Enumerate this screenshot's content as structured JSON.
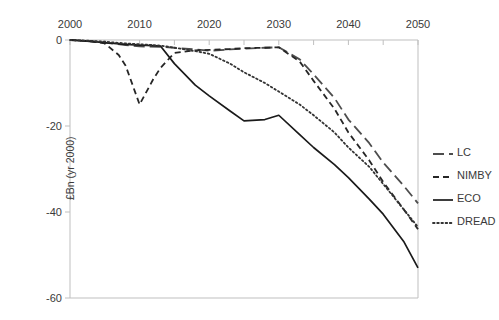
{
  "chart_data": {
    "type": "line",
    "title": "",
    "xlabel": "",
    "ylabel": "£Bn (yr 2000)",
    "xlim": [
      2000,
      2050
    ],
    "ylim": [
      -60,
      0
    ],
    "x_ticks": [
      2000,
      2010,
      2020,
      2030,
      2040,
      2050
    ],
    "x_tick_labels": [
      "2000",
      "2010",
      "2020",
      "2030",
      "2040",
      "2050"
    ],
    "x_minor_tick_interval": 5,
    "y_ticks": [
      0,
      -20,
      -40,
      -60
    ],
    "y_tick_labels": [
      "0",
      "-20",
      "-40",
      "-60"
    ],
    "grid": false,
    "x_axis_position": "top",
    "legend_position": "right",
    "series": [
      {
        "name": "LC",
        "style": "long-dash",
        "color": "#4d4d4d",
        "x": [
          2000,
          2003,
          2005,
          2008,
          2010,
          2013,
          2015,
          2018,
          2020,
          2023,
          2025,
          2028,
          2030,
          2033,
          2035,
          2038,
          2040,
          2043,
          2045,
          2048,
          2050
        ],
        "values": [
          0,
          -0.3,
          -0.6,
          -1.2,
          -1.5,
          -1.6,
          -1.8,
          -2.2,
          -2.5,
          -2.2,
          -2.0,
          -1.8,
          -1.7,
          -4.5,
          -8.0,
          -13.5,
          -18.5,
          -24.0,
          -28.5,
          -34.0,
          -38.0
        ]
      },
      {
        "name": "NIMBY",
        "style": "dash",
        "color": "#262626",
        "x": [
          2000,
          2003,
          2005,
          2007,
          2008,
          2010,
          2012,
          2013,
          2015,
          2017,
          2018,
          2020,
          2023,
          2025,
          2028,
          2030,
          2033,
          2035,
          2038,
          2040,
          2043,
          2045,
          2048,
          2050
        ],
        "values": [
          0,
          -0.3,
          -0.8,
          -3.5,
          -6.0,
          -15.0,
          -9.0,
          -6.5,
          -3.0,
          -2.6,
          -2.4,
          -2.3,
          -2.1,
          -1.9,
          -1.8,
          -1.7,
          -5.0,
          -9.5,
          -16.0,
          -21.5,
          -28.0,
          -33.0,
          -39.5,
          -44.0
        ]
      },
      {
        "name": "ECO",
        "style": "solid",
        "color": "#1a1a1a",
        "x": [
          2000,
          2003,
          2005,
          2008,
          2010,
          2012,
          2013,
          2015,
          2018,
          2020,
          2023,
          2025,
          2028,
          2030,
          2033,
          2035,
          2038,
          2040,
          2043,
          2045,
          2048,
          2050
        ],
        "values": [
          0,
          -0.3,
          -0.6,
          -1.0,
          -1.2,
          -1.3,
          -1.4,
          -5.5,
          -10.5,
          -13.0,
          -16.5,
          -18.8,
          -18.5,
          -17.5,
          -22.0,
          -25.0,
          -29.0,
          -32.0,
          -37.0,
          -40.5,
          -47.0,
          -53.0
        ]
      },
      {
        "name": "DREAD",
        "style": "dot",
        "color": "#333333",
        "x": [
          2000,
          2003,
          2005,
          2008,
          2010,
          2013,
          2015,
          2018,
          2020,
          2023,
          2025,
          2028,
          2030,
          2033,
          2035,
          2038,
          2040,
          2043,
          2045,
          2048,
          2050
        ],
        "values": [
          0,
          -0.2,
          -0.4,
          -0.8,
          -1.0,
          -1.3,
          -1.8,
          -2.6,
          -3.2,
          -5.5,
          -7.5,
          -10.0,
          -12.0,
          -15.0,
          -17.5,
          -21.5,
          -25.0,
          -29.5,
          -33.5,
          -39.5,
          -43.5
        ]
      }
    ],
    "legend": [
      {
        "label": "LC",
        "style": "long-dash"
      },
      {
        "label": "NIMBY",
        "style": "dash"
      },
      {
        "label": "ECO",
        "style": "solid"
      },
      {
        "label": "DREAD",
        "style": "dot"
      }
    ]
  },
  "colors": {
    "axis": "#bfbfbf",
    "text": "#3a3a3a",
    "background": "#ffffff"
  }
}
